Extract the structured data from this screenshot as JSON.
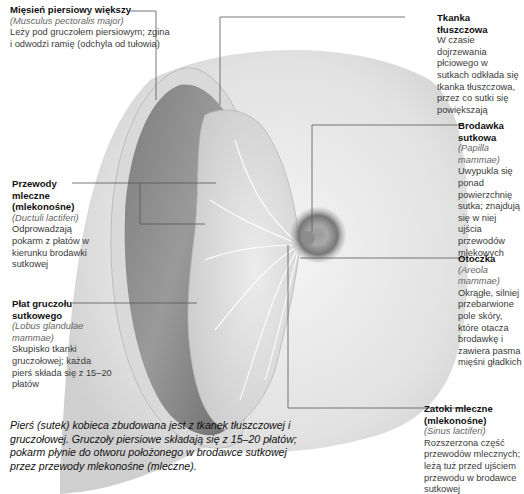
{
  "labels": {
    "pectoralis": {
      "title": "Mięsień piersiowy większy",
      "latin": "(Musculus pectoralis major)",
      "desc": "Leży pod gruczołem piersiowym; zgina i odwodzi ramię (odchyla od tułowia)"
    },
    "fat": {
      "title": "Tkanka tłuszczowa",
      "desc": "W czasie dojrzewania płciowego w sutkach odkłada się tkanka tłuszczowa, przez co sutki się powiększają"
    },
    "nipple": {
      "title": "Brodawka sutkowa",
      "latin": "(Papilla mammae)",
      "desc": "Uwypukla się ponad powierzchnię sutka; znajdują się w niej ujścia przewodów mlekowych"
    },
    "ducts": {
      "title": "Przewody mleczne (mlekonośne)",
      "latin": "(Ductuli lactiferi)",
      "desc": "Odprowadzają pokarm z płatów w kierunku brodawki sutkowej"
    },
    "areola": {
      "title": "Otoczka",
      "latin": "(Areola mammae)",
      "desc": "Okrągłe, silniej przebarwione pole skóry, które otacza brodawkę i zawiera pasma mięśni gładkich"
    },
    "lobe": {
      "title": "Płat gruczołu sutkowego",
      "latin": "(Lobus glandulae mammae)",
      "desc": "Skupisko tkanki gruczołowej; każda pierś składa się z 15–20 płatów"
    },
    "sinus": {
      "title": "Zatoki mleczne (mlekonośne)",
      "latin": "(Sinus lactiferi)",
      "desc": "Rozszerzona część przewodów mlecznych; leżą tuż przed ujściem przewodu w brodawce sutkowej"
    }
  },
  "caption": "Pierś (sutek) kobieca zbudowana jest z tkanek tłuszczowej i gruczołowej. Gruczoły piersiowe składają się z 15–20 płatów; pokarm płynie do otworu położonego w brodawce sutkowej przez przewody mlekonośne (mleczne).",
  "colors": {
    "background": "#ffffff",
    "skin": "#e6e6e6",
    "muscle": "#8a8a8a",
    "gland": "#d4d4d4",
    "areola": "#7a7a7a",
    "leader_line": "#555555"
  }
}
